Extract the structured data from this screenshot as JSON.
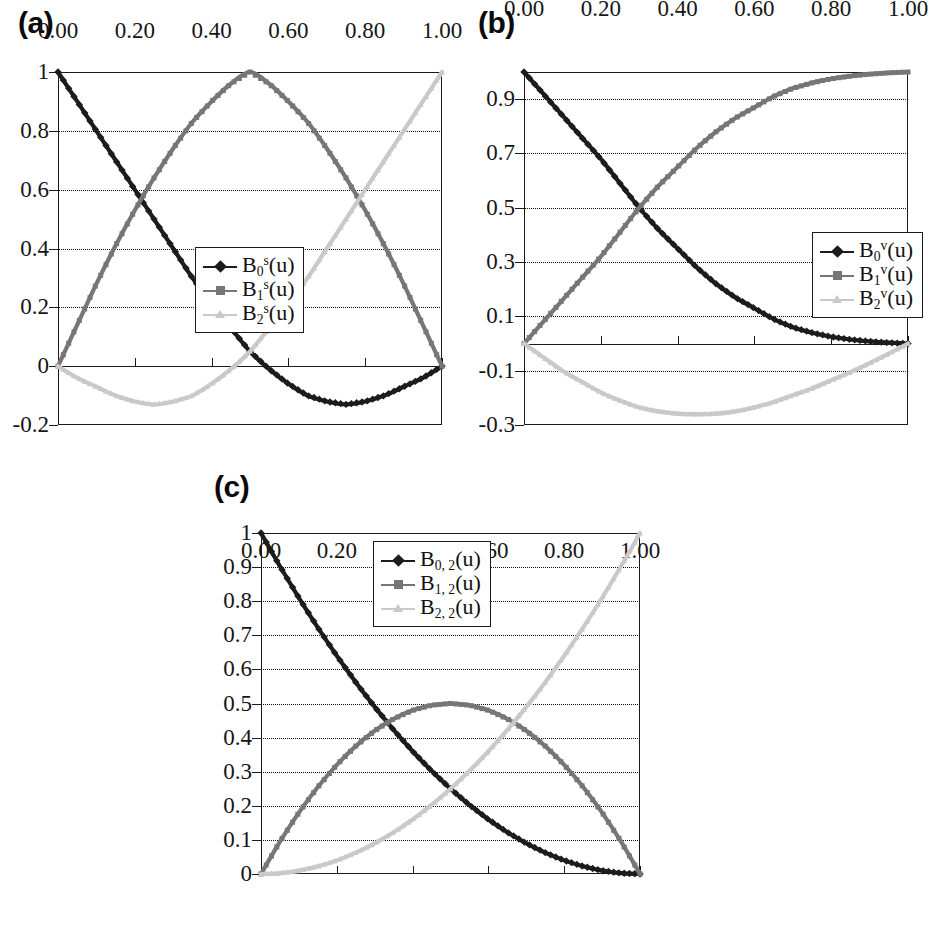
{
  "figure": {
    "panels": [
      {
        "label": "(a)",
        "legend": [
          {
            "name": "B",
            "sub": "0",
            "sup": "s",
            "arg": "(u)",
            "text": "B0s(u)",
            "color": "#1c1c1c",
            "marker": "diamond"
          },
          {
            "name": "B",
            "sub": "1",
            "sup": "s",
            "arg": "(u)",
            "text": "B1s(u)",
            "color": "#767676",
            "marker": "square"
          },
          {
            "name": "B",
            "sub": "2",
            "sup": "s",
            "arg": "(u)",
            "text": "B2s(u)",
            "color": "#c9c9c9",
            "marker": "tri"
          }
        ]
      },
      {
        "label": "(b)",
        "legend": [
          {
            "name": "B",
            "sub": "0",
            "sup": "v",
            "arg": "(u)",
            "text": "B0v(u)",
            "color": "#1c1c1c",
            "marker": "diamond"
          },
          {
            "name": "B",
            "sub": "1",
            "sup": "v",
            "arg": "(u)",
            "text": "B1v(u)",
            "color": "#767676",
            "marker": "square"
          },
          {
            "name": "B",
            "sub": "2",
            "sup": "v",
            "arg": "(u)",
            "text": "B2v(u)",
            "color": "#c9c9c9",
            "marker": "tri"
          }
        ]
      },
      {
        "label": "(c)",
        "legend": [
          {
            "name": "B",
            "sub": "0, 2",
            "sup": "",
            "arg": "(u)",
            "text": "B0,2(u)",
            "color": "#1c1c1c",
            "marker": "diamond"
          },
          {
            "name": "B",
            "sub": "1, 2",
            "sup": "",
            "arg": "(u)",
            "text": "B1,2(u)",
            "color": "#767676",
            "marker": "square"
          },
          {
            "name": "B",
            "sub": "2, 2",
            "sup": "",
            "arg": "(u)",
            "text": "B2,2(u)",
            "color": "#c9c9c9",
            "marker": "tri"
          }
        ]
      }
    ]
  },
  "chart_data": [
    {
      "type": "line",
      "title": "(a)",
      "xlabel": "",
      "ylabel": "",
      "xlim": [
        0.0,
        1.0
      ],
      "ylim": [
        -0.2,
        1.0
      ],
      "xticks": [
        "0.00",
        "0.20",
        "0.40",
        "0.60",
        "0.80",
        "1.00"
      ],
      "xtick_values": [
        0.0,
        0.2,
        0.4,
        0.6,
        0.8,
        1.0
      ],
      "yticks": [
        "1",
        "0.8",
        "0.6",
        "0.4",
        "0.2",
        "0",
        "-0.2"
      ],
      "ytick_values": [
        1.0,
        0.8,
        0.6,
        0.4,
        0.2,
        0.0,
        -0.2
      ],
      "grid": true,
      "legend_position": "center",
      "x": [
        0.0,
        0.05,
        0.1,
        0.15,
        0.2,
        0.25,
        0.3,
        0.35,
        0.4,
        0.45,
        0.5,
        0.55,
        0.6,
        0.65,
        0.7,
        0.75,
        0.8,
        0.85,
        0.9,
        0.95,
        1.0
      ],
      "series": [
        {
          "name": "B0s(u)",
          "color": "#1c1c1c",
          "marker": "diamond",
          "values": [
            1.0,
            0.9,
            0.8,
            0.7,
            0.6,
            0.5,
            0.4,
            0.3,
            0.21,
            0.13,
            0.05,
            -0.01,
            -0.06,
            -0.1,
            -0.12,
            -0.13,
            -0.12,
            -0.1,
            -0.07,
            -0.04,
            0.0
          ]
        },
        {
          "name": "B1s(u)",
          "color": "#767676",
          "marker": "square",
          "values": [
            0.0,
            0.14,
            0.28,
            0.41,
            0.53,
            0.64,
            0.74,
            0.83,
            0.9,
            0.96,
            1.0,
            0.96,
            0.9,
            0.83,
            0.74,
            0.64,
            0.53,
            0.41,
            0.28,
            0.14,
            0.0
          ]
        },
        {
          "name": "B2s(u)",
          "color": "#c9c9c9",
          "marker": "tri",
          "values": [
            0.0,
            -0.04,
            -0.07,
            -0.1,
            -0.12,
            -0.13,
            -0.12,
            -0.1,
            -0.06,
            -0.01,
            0.05,
            0.13,
            0.21,
            0.3,
            0.4,
            0.5,
            0.6,
            0.7,
            0.8,
            0.9,
            1.0
          ]
        }
      ]
    },
    {
      "type": "line",
      "title": "(b)",
      "xlabel": "",
      "ylabel": "",
      "xlim": [
        0.0,
        1.0
      ],
      "ylim": [
        -0.3,
        1.0
      ],
      "xticks": [
        "0.00",
        "0.20",
        "0.40",
        "0.60",
        "0.80",
        "1.00"
      ],
      "xtick_values": [
        0.0,
        0.2,
        0.4,
        0.6,
        0.8,
        1.0
      ],
      "yticks": [
        "0.9",
        "0.7",
        "0.5",
        "0.3",
        "0.1",
        "-0.1",
        "-0.3"
      ],
      "ytick_values": [
        0.9,
        0.7,
        0.5,
        0.3,
        0.1,
        -0.1,
        -0.3
      ],
      "grid": true,
      "legend_position": "right",
      "x": [
        0.0,
        0.05,
        0.1,
        0.15,
        0.2,
        0.25,
        0.3,
        0.35,
        0.4,
        0.45,
        0.5,
        0.55,
        0.6,
        0.65,
        0.7,
        0.75,
        0.8,
        0.85,
        0.9,
        0.95,
        1.0
      ],
      "series": [
        {
          "name": "B0v(u)",
          "color": "#1c1c1c",
          "marker": "diamond",
          "values": [
            1.0,
            0.92,
            0.84,
            0.76,
            0.68,
            0.59,
            0.5,
            0.42,
            0.35,
            0.28,
            0.22,
            0.17,
            0.13,
            0.09,
            0.06,
            0.04,
            0.025,
            0.015,
            0.008,
            0.003,
            0.0
          ]
        },
        {
          "name": "B1v(u)",
          "color": "#767676",
          "marker": "square",
          "values": [
            0.0,
            0.08,
            0.16,
            0.24,
            0.32,
            0.41,
            0.5,
            0.58,
            0.65,
            0.72,
            0.78,
            0.83,
            0.87,
            0.91,
            0.94,
            0.96,
            0.975,
            0.985,
            0.992,
            0.997,
            1.0
          ]
        },
        {
          "name": "B2v(u)",
          "color": "#c9c9c9",
          "marker": "tri",
          "values": [
            0.0,
            -0.05,
            -0.1,
            -0.14,
            -0.18,
            -0.21,
            -0.235,
            -0.25,
            -0.258,
            -0.26,
            -0.258,
            -0.25,
            -0.235,
            -0.215,
            -0.19,
            -0.165,
            -0.135,
            -0.105,
            -0.072,
            -0.037,
            0.0
          ]
        }
      ]
    },
    {
      "type": "line",
      "title": "(c)",
      "xlabel": "",
      "ylabel": "",
      "xlim": [
        0.0,
        1.0
      ],
      "ylim": [
        0.0,
        1.0
      ],
      "xticks": [
        "0.00",
        "0.20",
        "0.40",
        "0.60",
        "0.80",
        "1.00"
      ],
      "xtick_values": [
        0.0,
        0.2,
        0.4,
        0.6,
        0.8,
        1.0
      ],
      "yticks": [
        "1",
        "0.9",
        "0.8",
        "0.7",
        "0.6",
        "0.5",
        "0.4",
        "0.3",
        "0.2",
        "0.1",
        "0"
      ],
      "ytick_values": [
        1.0,
        0.9,
        0.8,
        0.7,
        0.6,
        0.5,
        0.4,
        0.3,
        0.2,
        0.1,
        0.0
      ],
      "grid": true,
      "legend_position": "upper-center",
      "x": [
        0.0,
        0.05,
        0.1,
        0.15,
        0.2,
        0.25,
        0.3,
        0.35,
        0.4,
        0.45,
        0.5,
        0.55,
        0.6,
        0.65,
        0.7,
        0.75,
        0.8,
        0.85,
        0.9,
        0.95,
        1.0
      ],
      "series": [
        {
          "name": "B0,2(u)",
          "color": "#1c1c1c",
          "marker": "diamond",
          "values": [
            1.0,
            0.9025,
            0.81,
            0.7225,
            0.64,
            0.5625,
            0.49,
            0.4225,
            0.36,
            0.3025,
            0.25,
            0.2025,
            0.16,
            0.1225,
            0.09,
            0.0625,
            0.04,
            0.0225,
            0.01,
            0.0025,
            0.0
          ]
        },
        {
          "name": "B1,2(u)",
          "color": "#767676",
          "marker": "square",
          "values": [
            0.0,
            0.095,
            0.18,
            0.255,
            0.32,
            0.375,
            0.42,
            0.455,
            0.48,
            0.495,
            0.5,
            0.495,
            0.48,
            0.455,
            0.42,
            0.375,
            0.32,
            0.255,
            0.18,
            0.095,
            0.0
          ]
        },
        {
          "name": "B2,2(u)",
          "color": "#c9c9c9",
          "marker": "tri",
          "values": [
            0.0,
            0.0025,
            0.01,
            0.0225,
            0.04,
            0.0625,
            0.09,
            0.1225,
            0.16,
            0.2025,
            0.25,
            0.3025,
            0.36,
            0.4225,
            0.49,
            0.5625,
            0.64,
            0.7225,
            0.81,
            0.9025,
            1.0
          ]
        }
      ]
    }
  ]
}
